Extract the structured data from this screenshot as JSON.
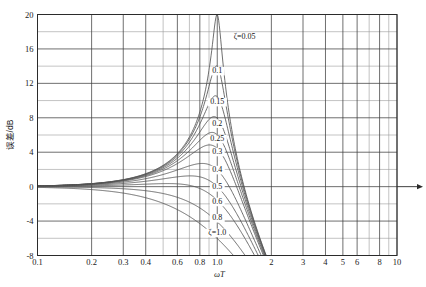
{
  "chart_data": {
    "type": "line",
    "title": "",
    "xlabel": "ωT",
    "ylabel": "误差/dB",
    "xscale": "log",
    "xlim": [
      0.1,
      10
    ],
    "ylim": [
      -8,
      20
    ],
    "grid": true,
    "legend_position": "inline-curve-labels",
    "x_ticks": [
      "0.1",
      "0.2",
      "0.3",
      "0.4",
      "0.6",
      "0.8",
      "1.0",
      "2",
      "3",
      "4",
      "5",
      "6",
      "8",
      "10"
    ],
    "x_tick_values": [
      0.1,
      0.2,
      0.3,
      0.4,
      0.6,
      0.8,
      1.0,
      2,
      3,
      4,
      5,
      6,
      8,
      10
    ],
    "x_minor_values": [
      0.5,
      0.7,
      0.9,
      7,
      9
    ],
    "y_ticks": [
      "20",
      "16",
      "12",
      "8",
      "4",
      "0",
      "-4",
      "-8"
    ],
    "y_tick_values": [
      20,
      16,
      12,
      8,
      4,
      0,
      -4,
      -8
    ],
    "y_minor_values": [
      18,
      14,
      10,
      6,
      2,
      -2,
      -6
    ],
    "parameter_symbol": "ζ",
    "series": [
      {
        "name": "ζ=0.05",
        "zeta": 0.05,
        "label": "ζ=0.05",
        "peak_db": 20.0,
        "label_x": 1.42,
        "label_y": 17.1
      },
      {
        "name": "0.1",
        "zeta": 0.1,
        "label": "0.1",
        "peak_db": 14.0,
        "label_x": 1.0,
        "label_y": 13.2
      },
      {
        "name": "0.15",
        "zeta": 0.15,
        "label": "0.15",
        "peak_db": 10.5,
        "label_x": 1.0,
        "label_y": 9.6
      },
      {
        "name": "0.2",
        "zeta": 0.2,
        "label": "0.2",
        "peak_db": 8.0,
        "label_x": 1.0,
        "label_y": 7.1
      },
      {
        "name": "0.25",
        "zeta": 0.25,
        "label": "0.25",
        "peak_db": 6.3,
        "label_x": 1.0,
        "label_y": 5.3
      },
      {
        "name": "0.3",
        "zeta": 0.3,
        "label": "0.3",
        "peak_db": 4.8,
        "label_x": 1.0,
        "label_y": 3.8
      },
      {
        "name": "0.4",
        "zeta": 0.4,
        "label": "0.4",
        "peak_db": 2.7,
        "label_x": 1.0,
        "label_y": 1.7
      },
      {
        "name": "0.5",
        "zeta": 0.5,
        "label": "0.5",
        "peak_db": 1.2,
        "label_x": 1.0,
        "label_y": -0.3
      },
      {
        "name": "0.6",
        "zeta": 0.6,
        "label": "0.6",
        "peak_db": 0.3,
        "label_x": 1.0,
        "label_y": -2.0
      },
      {
        "name": "0.8",
        "zeta": 0.8,
        "label": "0.8",
        "peak_db": -2.1,
        "label_x": 1.0,
        "label_y": -3.9
      },
      {
        "name": "ζ=1.0",
        "zeta": 1.0,
        "label": "ζ=1.0",
        "peak_db": -6.0,
        "label_x": 1.0,
        "label_y": -5.6
      }
    ]
  },
  "axes": {
    "arrow_right": true
  },
  "colors": {
    "curve": "#555555",
    "grid_major": "#3f3f3f",
    "grid_minor": "#9a9a9a",
    "frame": "#2b2b2b",
    "text": "#1a1a1a",
    "background": "#ffffff"
  }
}
